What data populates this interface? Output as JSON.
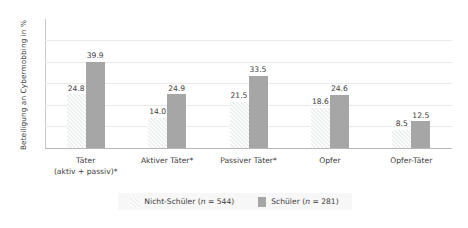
{
  "chart_data": {
    "type": "bar",
    "title": "",
    "xlabel": "",
    "ylabel": "Beteiligung an Cybermobbing in %",
    "ylim": [
      0,
      50
    ],
    "yticks": [
      0,
      10,
      20,
      30,
      40,
      50
    ],
    "grid": true,
    "legend_position": "bottom",
    "categories": [
      "Täter\n(aktiv + passiv)*",
      "Aktiver Täter*",
      "Passiver Täter*",
      "Opfer",
      "Opfer-Täter"
    ],
    "series": [
      {
        "name": "Nicht-Schüler",
        "legend_label": "Nicht-Schüler (n = 544)",
        "n": 544,
        "color": "#eceff0",
        "pattern": "diagonal-hatch",
        "values": [
          24.8,
          14.0,
          21.5,
          18.6,
          8.5
        ],
        "value_labels": [
          "24.8",
          "14.0",
          "21.5",
          "18.6",
          "8.5"
        ]
      },
      {
        "name": "Schüler",
        "legend_label": "Schüler (n = 281)",
        "n": 281,
        "color": "#a6a6a6",
        "pattern": "solid",
        "values": [
          39.9,
          24.9,
          33.5,
          24.6,
          12.5
        ],
        "value_labels": [
          "39.9",
          "24.9",
          "33.5",
          "24.6",
          "12.5"
        ]
      }
    ]
  },
  "legend": {
    "items": [
      {
        "prefix": "Nicht-Schüler (",
        "italic": "n",
        "suffix": " = 544)"
      },
      {
        "prefix": "Schüler (",
        "italic": "n",
        "suffix": " = 281)"
      }
    ]
  }
}
